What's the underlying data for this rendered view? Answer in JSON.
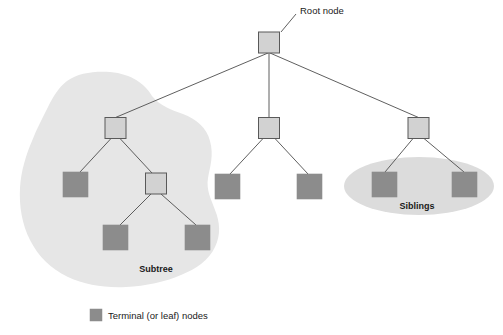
{
  "figure": {
    "title_label": "Root node",
    "width": 503,
    "height": 335,
    "background_color": "#ffffff"
  },
  "colors": {
    "internal_node_fill": "#d2d2d2",
    "internal_node_stroke": "#595959",
    "leaf_node_fill": "#8c8c8c",
    "leaf_node_stroke": "#8c8c8c",
    "edge_stroke": "#4d4d4d",
    "subtree_region_fill": "#e6e6e6",
    "siblings_region_fill": "#dcdcdc",
    "text_color": "#1a1a1a"
  },
  "annotations": {
    "root_label": "Root node",
    "subtree_label": "Subtree",
    "siblings_label": "Siblings"
  },
  "legend": {
    "swatch_color": "#8c8c8c",
    "label": "Terminal (or leaf) nodes"
  },
  "tree": {
    "root": {
      "id": "root",
      "type": "internal",
      "x": 258.5,
      "y": 32,
      "w": 21,
      "h": 21
    },
    "nodes": [
      {
        "id": "n-left",
        "type": "internal",
        "x": 105,
        "y": 117.5,
        "w": 21,
        "h": 21
      },
      {
        "id": "n-middle",
        "type": "internal",
        "x": 258.5,
        "y": 117.5,
        "w": 21,
        "h": 21
      },
      {
        "id": "n-right",
        "type": "internal",
        "x": 408,
        "y": 117.5,
        "w": 21,
        "h": 21
      },
      {
        "id": "n-left-sub",
        "type": "internal",
        "x": 145.5,
        "y": 173,
        "w": 21,
        "h": 21
      },
      {
        "id": "leaf-l1",
        "type": "leaf",
        "x": 63,
        "y": 172,
        "w": 25,
        "h": 25
      },
      {
        "id": "leaf-l2",
        "type": "leaf",
        "x": 103,
        "y": 225,
        "w": 25,
        "h": 25
      },
      {
        "id": "leaf-l3",
        "type": "leaf",
        "x": 185,
        "y": 225,
        "w": 25,
        "h": 25
      },
      {
        "id": "leaf-m1",
        "type": "leaf",
        "x": 215,
        "y": 174,
        "w": 25,
        "h": 25
      },
      {
        "id": "leaf-m2",
        "type": "leaf",
        "x": 297,
        "y": 174,
        "w": 25,
        "h": 25
      },
      {
        "id": "leaf-r1",
        "type": "leaf",
        "x": 372,
        "y": 172,
        "w": 25,
        "h": 25
      },
      {
        "id": "leaf-r2",
        "type": "leaf",
        "x": 452,
        "y": 172,
        "w": 25,
        "h": 25
      }
    ],
    "edges": [
      {
        "from": "root",
        "to": "n-left",
        "x1": 268,
        "y1": 53,
        "x2": 115.5,
        "y2": 117.5
      },
      {
        "from": "root",
        "to": "n-middle",
        "x1": 269,
        "y1": 53,
        "x2": 269,
        "y2": 117.5
      },
      {
        "from": "root",
        "to": "n-right",
        "x1": 270,
        "y1": 53,
        "x2": 418.5,
        "y2": 117.5
      },
      {
        "from": "n-left",
        "to": "leaf-l1",
        "x1": 111,
        "y1": 138.5,
        "x2": 80,
        "y2": 172
      },
      {
        "from": "n-left",
        "to": "n-left-sub",
        "x1": 120,
        "y1": 138.5,
        "x2": 152,
        "y2": 173
      },
      {
        "from": "n-left-sub",
        "to": "leaf-l2",
        "x1": 151,
        "y1": 194,
        "x2": 120,
        "y2": 225
      },
      {
        "from": "n-left-sub",
        "to": "leaf-l3",
        "x1": 161,
        "y1": 194,
        "x2": 196,
        "y2": 225
      },
      {
        "from": "n-middle",
        "to": "leaf-m1",
        "x1": 263,
        "y1": 138.5,
        "x2": 230,
        "y2": 174
      },
      {
        "from": "n-middle",
        "to": "leaf-m2",
        "x1": 275,
        "y1": 138.5,
        "x2": 308,
        "y2": 174
      },
      {
        "from": "n-right",
        "to": "leaf-r1",
        "x1": 413,
        "y1": 138.5,
        "x2": 385,
        "y2": 172
      },
      {
        "from": "n-right",
        "to": "leaf-r2",
        "x1": 424,
        "y1": 138.5,
        "x2": 464,
        "y2": 172
      }
    ],
    "leader_line": {
      "x1": 281,
      "y1": 32,
      "x2": 295,
      "y2": 14
    }
  },
  "regions": {
    "subtree": {
      "label": "Subtree",
      "label_x": 156,
      "label_y": 272,
      "fill": "#e6e6e6"
    },
    "siblings": {
      "label": "Siblings",
      "label_x": 417,
      "label_y": 208,
      "cx": 419,
      "cy": 186,
      "rx": 75,
      "ry": 29,
      "fill": "#dcdcdc"
    }
  },
  "label_positions": {
    "root_label_x": 300,
    "root_label_y": 14,
    "legend_swatch_x": 90,
    "legend_swatch_y": 309,
    "legend_swatch_w": 12,
    "legend_swatch_h": 12,
    "legend_text_x": 108,
    "legend_text_y": 319
  }
}
